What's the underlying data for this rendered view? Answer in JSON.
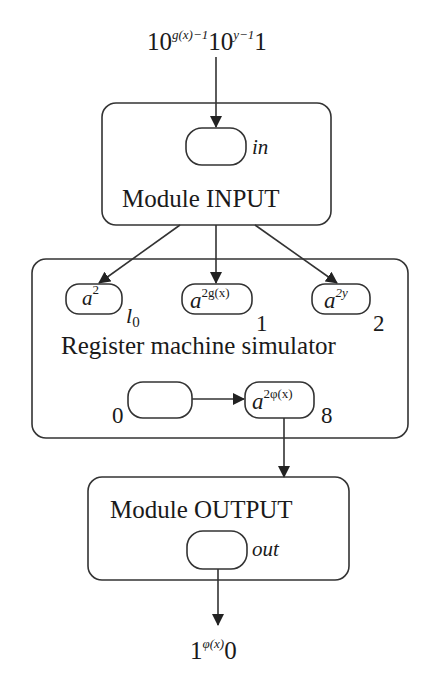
{
  "diagram": {
    "input_string": {
      "base1": "10",
      "exp1": "g(x)−1",
      "base2": "10",
      "exp2": "y−1",
      "tail": "1"
    },
    "module_input": {
      "title": "Module INPUT",
      "membrane_label": "in"
    },
    "register_simulator": {
      "title": "Register machine simulator",
      "membranes": [
        {
          "content_base": "a",
          "content_exp": "2",
          "label_base": "l",
          "label_sub": "0"
        },
        {
          "content_base": "a",
          "content_exp": "2g(x)",
          "label": "1"
        },
        {
          "content_base": "a",
          "content_exp": "2y",
          "label": "2"
        },
        {
          "content_base": "",
          "content_exp": "",
          "label": "0"
        },
        {
          "content_base": "a",
          "content_exp": "2φ(x)",
          "label": "8"
        }
      ]
    },
    "module_output": {
      "title": "Module OUTPUT",
      "membrane_label": "out"
    },
    "output_string": {
      "base": "1",
      "exp": "φ(x)",
      "tail": "0"
    },
    "colors": {
      "stroke": "#333333",
      "text": "#1a1a1a",
      "background": "#ffffff"
    }
  }
}
